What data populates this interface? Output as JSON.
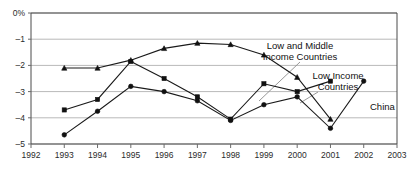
{
  "chart_data": {
    "type": "line",
    "title": "",
    "subtitle": "",
    "xlabel": "",
    "ylabel": "",
    "ylim": [
      -5,
      0
    ],
    "xlim": [
      1992,
      2003
    ],
    "grid": true,
    "legend_position": "inline-annotations",
    "y_ticks": [
      "0%",
      "-1",
      "-2",
      "-3",
      "-4",
      "-5"
    ],
    "y_tick_values": [
      0,
      -1,
      -2,
      -3,
      -4,
      -5
    ],
    "x_ticks": [
      "1992",
      "1993",
      "1994",
      "1995",
      "1996",
      "1997",
      "1998",
      "1999",
      "2000",
      "2001",
      "2002",
      "2003"
    ],
    "x_tick_values": [
      1992,
      1993,
      1994,
      1995,
      1996,
      1997,
      1998,
      1999,
      2000,
      2001,
      2002,
      2003
    ],
    "series": [
      {
        "name": "Low and Middle Income Countries",
        "marker": "triangle",
        "x": [
          1993,
          1994,
          1995,
          1996,
          1997,
          1998,
          1999,
          2000,
          2001
        ],
        "values": [
          -2.1,
          -2.1,
          -1.8,
          -1.35,
          -1.15,
          -1.2,
          -1.6,
          -2.45,
          -4.05
        ]
      },
      {
        "name": "Low Income Countries",
        "marker": "square",
        "x": [
          1993,
          1994,
          1995,
          1996,
          1997,
          1998,
          1999,
          2000,
          2001
        ],
        "values": [
          -3.7,
          -3.3,
          -1.85,
          -2.5,
          -3.2,
          -4.05,
          -2.7,
          -3.0,
          -2.6
        ]
      },
      {
        "name": "China",
        "marker": "circle",
        "x": [
          1993,
          1994,
          1995,
          1996,
          1997,
          1998,
          1999,
          2000,
          2001,
          2002
        ],
        "values": [
          -4.65,
          -3.75,
          -2.8,
          -3.0,
          -3.35,
          -4.1,
          -3.5,
          -3.2,
          -4.4,
          -2.6
        ]
      }
    ],
    "annotations": [
      {
        "id": "low-and-middle-income-countries",
        "line1": "Low and Middle",
        "line2": "Income Countries",
        "text": "Low and Middle Income Countries",
        "x": 300,
        "y": 49,
        "leader_from": [
          300,
          62
        ],
        "leader_to": [
          259,
          101
        ]
      },
      {
        "id": "low-income-countries",
        "line1": "Low Income",
        "line2": "Countries",
        "text": "Low Income Countries",
        "x": 338,
        "y": 79,
        "leader_from": [
          318,
          92
        ],
        "leader_to": [
          300,
          103
        ]
      },
      {
        "id": "china",
        "line1": "China",
        "line2": "",
        "text": "China",
        "x": 370,
        "y": 110,
        "leader_from": [
          0,
          0
        ],
        "leader_to": [
          0,
          0
        ]
      }
    ]
  }
}
